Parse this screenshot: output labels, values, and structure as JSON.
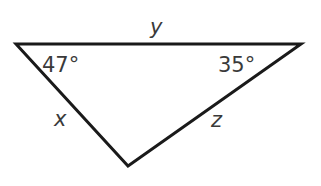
{
  "diagram": {
    "type": "triangle",
    "vertices": {
      "left": [
        16,
        44
      ],
      "right": [
        301,
        44
      ],
      "bottom": [
        128,
        166
      ]
    },
    "sides": {
      "top": {
        "label": "y"
      },
      "left": {
        "label": "x"
      },
      "right": {
        "label": "z"
      }
    },
    "angles": {
      "left": {
        "label": "47°"
      },
      "right": {
        "label": "35°"
      }
    },
    "colors": {
      "stroke": "#1a1a1a",
      "text": "#3a3a3a",
      "background": "#ffffff"
    }
  }
}
